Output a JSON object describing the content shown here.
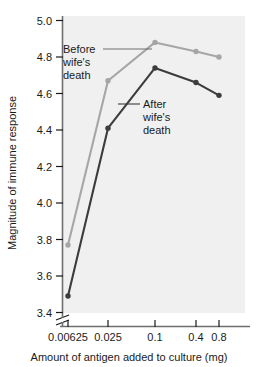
{
  "chart_data": {
    "type": "line",
    "title": "",
    "xlabel": "Amount of antigen added to culture (mg)",
    "ylabel": "Magnitude of immune response",
    "xscale": "log-category",
    "categories": [
      "0.00625",
      "0.025",
      "0.1",
      "0.4",
      "0.8"
    ],
    "xtick_labels": [
      "0.00625",
      "0.025",
      "0.1",
      "0.4",
      "0.8"
    ],
    "ytick_labels": [
      "3.4",
      "3.6",
      "3.8",
      "4.0",
      "4.2",
      "4.4",
      "4.6",
      "4.8",
      "5.0"
    ],
    "ylim": [
      3.4,
      5.0
    ],
    "y_axis_break": true,
    "grid": false,
    "legend": "inline-annotations",
    "series": [
      {
        "name": "Before wife's death",
        "color": "#a6a6a6",
        "values": [
          3.77,
          4.67,
          4.88,
          4.83,
          4.8
        ]
      },
      {
        "name": "After wife's death",
        "color": "#3c3c3c",
        "values": [
          3.49,
          4.41,
          4.74,
          4.66,
          4.59
        ]
      }
    ],
    "annotations": [
      {
        "name": "before-label",
        "lines": [
          "Before",
          "wife's",
          "death"
        ]
      },
      {
        "name": "after-label",
        "lines": [
          "After",
          "wife's",
          "death"
        ]
      }
    ],
    "panel_color": "#f0f0f0"
  },
  "labels": {
    "y_axis_title": "Magnitude of immune response",
    "x_axis_title": "Amount of antigen added to culture (mg)",
    "ytick_0": "3.4",
    "ytick_1": "3.6",
    "ytick_2": "3.8",
    "ytick_3": "4.0",
    "ytick_4": "4.2",
    "ytick_5": "4.4",
    "ytick_6": "4.6",
    "ytick_7": "4.8",
    "ytick_8": "5.0",
    "xtick_0": "0.00625",
    "xtick_1": "0.025",
    "xtick_2": "0.1",
    "xtick_3": "0.4",
    "xtick_4": "0.8",
    "annot_before_1": "Before",
    "annot_before_2": "wife's",
    "annot_before_3": "death",
    "annot_after_1": "After",
    "annot_after_2": "wife's",
    "annot_after_3": "death"
  }
}
